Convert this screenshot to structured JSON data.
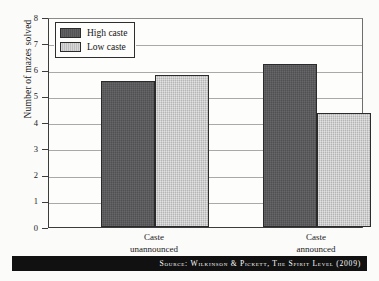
{
  "chart": {
    "ylabel": "Number of mazes solved",
    "yticks": [
      "0",
      "1",
      "2",
      "3",
      "4",
      "5",
      "6",
      "7",
      "8"
    ],
    "legend": [
      {
        "label": "High caste",
        "swatch": "high",
        "color": "#58585a"
      },
      {
        "label": "Low caste",
        "swatch": "low",
        "color": "#c8c8c8"
      }
    ],
    "categories": [
      {
        "line1": "Caste",
        "line2": "unannounced"
      },
      {
        "line1": "Caste",
        "line2": "announced"
      }
    ]
  },
  "source": {
    "text": "Source: Wilkinson & Pickett, The Spirit Level (2009)"
  },
  "chart_data": {
    "type": "bar",
    "title": "",
    "xlabel": "",
    "ylabel": "Number of mazes solved",
    "categories": [
      "Caste unannounced",
      "Caste announced"
    ],
    "series": [
      {
        "name": "High caste",
        "values": [
          5.55,
          6.2
        ],
        "color": "#58585a"
      },
      {
        "name": "Low caste",
        "values": [
          5.78,
          4.35
        ],
        "color": "#c8c8c8"
      }
    ],
    "ylim": [
      0,
      8
    ],
    "ytick_step": 1,
    "grid": true,
    "legend_position": "top-left",
    "annotations": [
      "Source: Wilkinson & Pickett, The Spirit Level (2009)"
    ]
  }
}
